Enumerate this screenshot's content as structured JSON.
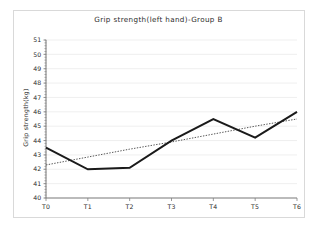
{
  "figure": {
    "background_color": "#ffffff",
    "frame_color": "#d9d9d9",
    "axis_color": "#808080",
    "grid_color": "#e8e8e8",
    "series_color": "#1a1a1a",
    "trend_color": "#555555"
  },
  "chart_data": {
    "type": "line",
    "title": "Grip strength(left hand)-Group B",
    "xlabel": "",
    "ylabel": "Grip strength(kg)",
    "categories": [
      "T0",
      "T1",
      "T2",
      "T3",
      "T4",
      "T5",
      "T6"
    ],
    "series": [
      {
        "name": "Grip strength (left hand), Group B",
        "style": "solid",
        "values": [
          43.5,
          42.0,
          42.1,
          44.0,
          45.5,
          44.2,
          46.0
        ]
      },
      {
        "name": "Linear trendline",
        "style": "dotted",
        "values": [
          42.3,
          42.85,
          43.4,
          43.9,
          44.45,
          45.0,
          45.5
        ]
      }
    ],
    "ylim": [
      40,
      51
    ],
    "yticks": [
      40,
      41,
      42,
      43,
      44,
      45,
      46,
      47,
      48,
      49,
      50,
      51
    ],
    "ytick_labels": [
      "40",
      "41",
      "42",
      "43",
      "44",
      "45",
      "46",
      "47",
      "48",
      "49",
      "50",
      "51"
    ],
    "xtick_labels": [
      "T0",
      "T1",
      "T2",
      "T3",
      "T4",
      "T5",
      "T6"
    ],
    "grid": true,
    "grid_axis": "y",
    "legend": false
  }
}
